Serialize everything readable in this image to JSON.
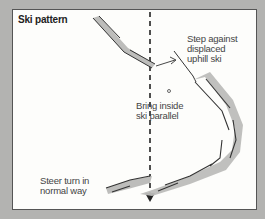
{
  "title": "Ski pattern",
  "labels": {
    "step_against": "Step against\ndisplaced\nuphill ski",
    "bring_inside": "Bring inside\nski parallel",
    "steer_turn": "Steer turn in\nnormal way"
  },
  "colors": {
    "background": "#b3b3b1",
    "panel": "#fdfdfb",
    "ski_fill": "#bdbdbb",
    "ink": "#222222"
  },
  "icons": {
    "fall_line_arrow": "arrow-down",
    "step_arrow": "arrow-right"
  }
}
